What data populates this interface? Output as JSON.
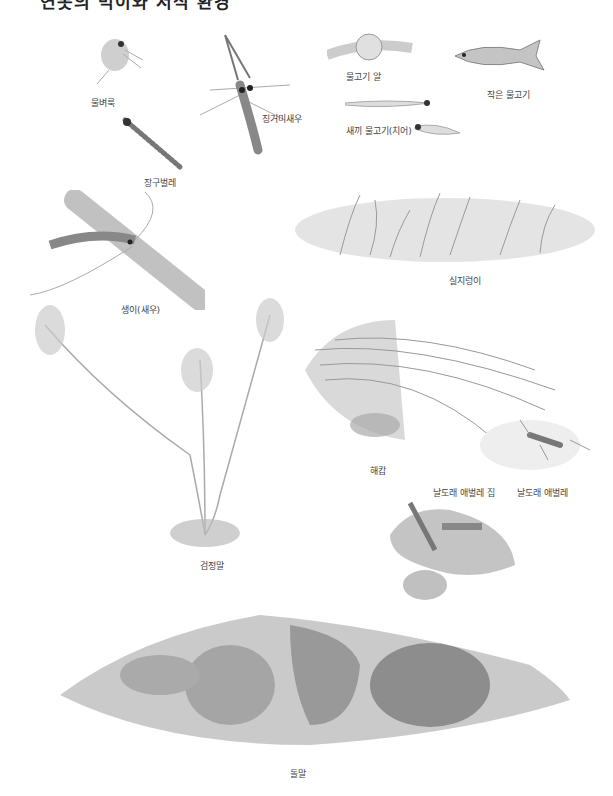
{
  "page": {
    "title": "연못의 먹이와 서식 환경",
    "labels": {
      "water_flea": "물벼룩",
      "long_arm_shrimp": "징거미새우",
      "fish_egg": "물고기 알",
      "small_fish": "작은 물고기",
      "fry": "새끼 물고기(치어)",
      "dragonfly_larva": "잠자리 애벌레",
      "caddisfly_nymph": "장구벌레",
      "freshwater_shrimp": "생이(새우)",
      "moss_grass": "실지렁이",
      "hydrilla": "검정말",
      "filamentous_algae": "해캄",
      "caddis_case": "날도래 애벌레 집",
      "caddis_larva": "날도래 애벌레",
      "stone_algae": "돌말"
    }
  },
  "colors": {
    "ink": "#444444",
    "shade_dark": "#7a7a7a",
    "shade_mid": "#a8a8a8",
    "shade_light": "#d6d6d6"
  }
}
